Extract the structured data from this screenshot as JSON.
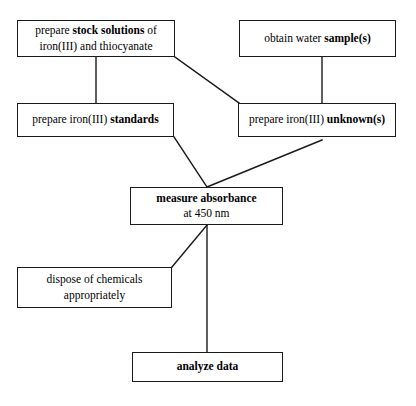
{
  "diagram": {
    "stroke_color": "#1a1a1a",
    "background_color": "#ffffff",
    "nodes": [
      {
        "id": "prepare-stock-solutions",
        "line1_a": "prepare ",
        "line1_b": "stock solutions",
        "line1_c": " of",
        "line2_a": "iron(III) and thiocyanate"
      },
      {
        "id": "obtain-water-samples",
        "line1_a": "obtain water ",
        "line1_b": "sample(s)"
      },
      {
        "id": "prepare-iron-standards",
        "line1_a": "prepare iron(III) ",
        "line1_b": "standards"
      },
      {
        "id": "prepare-iron-unknowns",
        "line1_a": "prepare iron(III) ",
        "line1_b": "unknown(s)"
      },
      {
        "id": "measure-absorbance",
        "line1_b": "measure absorbance",
        "line2_a": "at 450 nm"
      },
      {
        "id": "dispose-of-chemicals",
        "line1_a": "dispose of chemicals",
        "line2_a": "appropriately"
      },
      {
        "id": "analyze-data",
        "line1_b": "analyze data"
      }
    ]
  }
}
